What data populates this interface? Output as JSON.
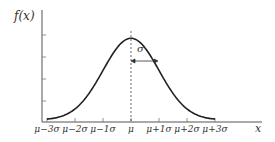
{
  "chart_data": {
    "type": "line",
    "xlabel": "x",
    "ylabel": "f(x)",
    "x_tick_labels": [
      "μ−3σ",
      "μ−2σ",
      "μ−1σ",
      "μ",
      "μ+1σ",
      "μ+2σ",
      "μ+3σ"
    ],
    "x_tick_values": [
      -3,
      -2,
      -1,
      0,
      1,
      2,
      3
    ],
    "y_ticks_count": 4,
    "y_tick_labels": [],
    "series": [
      {
        "name": "f(x)",
        "function": "normal_pdf",
        "mean": 0,
        "std": 1,
        "x": [
          -3,
          -2.5,
          -2,
          -1.5,
          -1,
          -0.5,
          0,
          0.5,
          1,
          1.5,
          2,
          2.5,
          3
        ],
        "values": [
          0.0044,
          0.0175,
          0.054,
          0.1295,
          0.242,
          0.3521,
          0.3989,
          0.3521,
          0.242,
          0.1295,
          0.054,
          0.0175,
          0.0044
        ]
      }
    ],
    "annotations": [
      {
        "type": "vertical-dashed-line",
        "at": "μ"
      },
      {
        "type": "double-arrow",
        "from": "μ",
        "to": "μ+1σ",
        "label": "σ"
      }
    ],
    "grid": false,
    "legend": null,
    "colors": {
      "curve": "#222222",
      "axis": "#555555",
      "text": "#333333"
    }
  },
  "labels": {
    "y_axis": "f(x)",
    "x_axis": "x",
    "sigma": "σ",
    "ticks": [
      "μ−3σ",
      "μ−2σ",
      "μ−1σ",
      "μ",
      "μ+1σ",
      "μ+2σ",
      "μ+3σ"
    ]
  }
}
